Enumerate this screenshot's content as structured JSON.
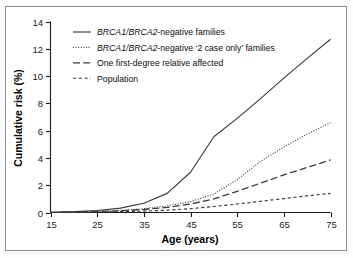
{
  "figure": {
    "border_color": "#8d8d8d",
    "background": "#ffffff"
  },
  "axes": {
    "x_title": "Age (years)",
    "y_title": "Cumulative risk (%)",
    "x_ticks": [
      "15",
      "25",
      "35",
      "45",
      "55",
      "65",
      "75"
    ],
    "y_ticks": [
      "0",
      "2",
      "4",
      "6",
      "8",
      "10",
      "12",
      "14"
    ]
  },
  "legend": [
    {
      "style": "solid",
      "prefix_italic": "BRCA1/BRCA2",
      "rest": "-negative families"
    },
    {
      "style": "dotted",
      "prefix_italic": "BRCA1/BRCA2",
      "rest": "-negative ‘2 case only’ families"
    },
    {
      "style": "dashdot",
      "prefix_italic": "",
      "rest": "One first-degree relative affected"
    },
    {
      "style": "dashed",
      "prefix_italic": "",
      "rest": "Population"
    }
  ],
  "chart_data": {
    "type": "line",
    "title": "",
    "xlabel": "Age (years)",
    "ylabel": "Cumulative risk (%)",
    "xlim": [
      15,
      75
    ],
    "ylim": [
      0,
      14
    ],
    "xticks": [
      15,
      25,
      35,
      45,
      55,
      65,
      75
    ],
    "yticks": [
      0,
      2,
      4,
      6,
      8,
      10,
      12,
      14
    ],
    "grid": false,
    "legend_position": "upper left",
    "line_color": "#3b3b3b",
    "x": [
      15,
      20,
      25,
      30,
      35,
      40,
      45,
      50,
      55,
      60,
      65,
      70,
      75
    ],
    "series": [
      {
        "name": "BRCA1/BRCA2-negative families",
        "style": "solid",
        "values": [
          0.02,
          0.06,
          0.15,
          0.32,
          0.68,
          1.4,
          2.95,
          5.55,
          6.9,
          8.35,
          9.85,
          11.3,
          12.7
        ]
      },
      {
        "name": "BRCA1/BRCA2-negative '2 case only' families",
        "style": "dotted",
        "values": [
          0.01,
          0.03,
          0.08,
          0.15,
          0.28,
          0.48,
          0.8,
          1.35,
          2.4,
          3.75,
          4.8,
          5.75,
          6.6
        ]
      },
      {
        "name": "One first-degree relative affected",
        "style": "dashdot",
        "values": [
          0.01,
          0.03,
          0.07,
          0.13,
          0.22,
          0.38,
          0.62,
          1.0,
          1.55,
          2.15,
          2.75,
          3.3,
          3.85
        ]
      },
      {
        "name": "Population",
        "style": "dashed",
        "values": [
          0.0,
          0.01,
          0.03,
          0.06,
          0.1,
          0.17,
          0.28,
          0.44,
          0.62,
          0.82,
          1.02,
          1.22,
          1.4
        ]
      }
    ]
  }
}
